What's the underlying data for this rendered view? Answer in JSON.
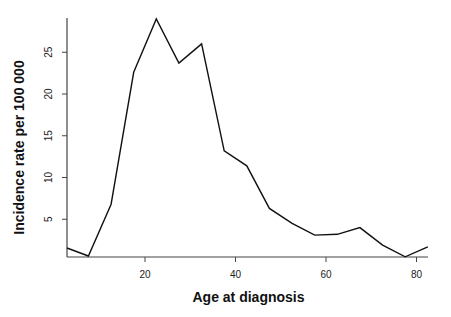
{
  "chart_data": {
    "type": "line",
    "title": "",
    "xlabel": "Age at diagnosis",
    "ylabel": "Incidence rate per 100 000",
    "x": [
      2.5,
      7.5,
      12.5,
      17.5,
      22.5,
      27.5,
      32.5,
      37.5,
      42.5,
      47.5,
      52.5,
      57.5,
      62.5,
      67.5,
      72.5,
      77.5,
      82.5
    ],
    "series": [
      {
        "name": "Incidence rate",
        "values": [
          1.6,
          0.6,
          6.8,
          22.6,
          29.0,
          23.7,
          26.0,
          13.2,
          11.4,
          6.3,
          4.5,
          3.1,
          3.2,
          4.0,
          1.9,
          0.5,
          1.7
        ],
        "color": "#111111"
      }
    ],
    "xticks": [
      20,
      40,
      60,
      80
    ],
    "yticks": [
      5,
      10,
      15,
      20,
      25
    ],
    "xlim": [
      2.7,
      82.5
    ],
    "ylim": [
      0.5,
      29.5
    ],
    "grid": false,
    "legend": null,
    "axes_style": "L-shaped (left and bottom only)"
  }
}
